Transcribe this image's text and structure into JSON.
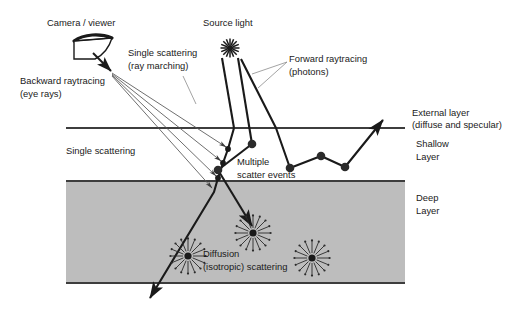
{
  "figure": {
    "background_color": "#ffffff",
    "line_color": "#1a1a1a",
    "deep_layer_fill": "#bdbdbd",
    "leader_color": "#7a7a7a"
  },
  "labels": {
    "camera_viewer": "Camera / viewer",
    "source_light": "Source light",
    "single_scattering_ray_marching_l1": "Single scattering",
    "single_scattering_ray_marching_l2": "(ray marching)",
    "forward_raytracing_l1": "Forward raytracing",
    "forward_raytracing_l2": "(photons)",
    "backward_raytracing_l1": "Backward raytracing",
    "backward_raytracing_l2": "(eye rays)",
    "single_scattering": "Single scattering",
    "multiple_scatter_l1": "Multiple",
    "multiple_scatter_l2": "scatter events",
    "external_layer_l1": "External layer",
    "external_layer_l2": "(diffuse and specular)",
    "shallow_layer_l1": "Shallow",
    "shallow_layer_l2": "Layer",
    "deep_layer_l1": "Deep",
    "deep_layer_l2": "Layer",
    "diffusion_l1": "Diffusion",
    "diffusion_l2": "(isotropic) scattering"
  },
  "geometry": {
    "surface_line_y": 128,
    "deep_boundary_y": 181,
    "deep_bottom_y": 283,
    "layer_left_x": 66,
    "layer_right_x": 405,
    "camera_point": {
      "x": 110,
      "y": 72
    },
    "source_light": {
      "x": 230,
      "y": 48
    }
  },
  "icons": {
    "camera": "camera-viewer-icon",
    "light": "source-light-starburst-icon",
    "diffusion": "isotropic-starburst-icon"
  },
  "scatter_events": {
    "single_scatter_dots": [
      {
        "x": 228,
        "y": 149
      },
      {
        "x": 223,
        "y": 163
      },
      {
        "x": 218,
        "y": 178
      }
    ],
    "multiple_scatter_dots": [
      {
        "x": 252,
        "y": 144
      },
      {
        "x": 218,
        "y": 170
      },
      {
        "x": 290,
        "y": 168
      },
      {
        "x": 321,
        "y": 156
      },
      {
        "x": 345,
        "y": 167
      }
    ],
    "diffusion_points": [
      {
        "x": 188,
        "y": 256
      },
      {
        "x": 253,
        "y": 233
      },
      {
        "x": 312,
        "y": 258
      }
    ]
  }
}
